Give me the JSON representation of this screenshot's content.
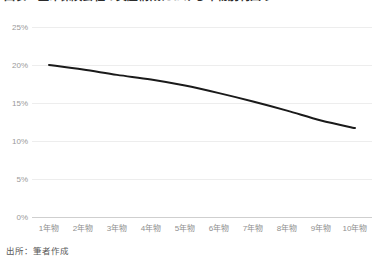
{
  "chart_data": {
    "type": "line",
    "title": "図表　生命保険会社の資産構成における年物別利回り",
    "subtitle": "",
    "xlabel": "",
    "ylabel": "",
    "categories": [
      "1年物",
      "2年物",
      "3年物",
      "4年物",
      "5年物",
      "6年物",
      "7年物",
      "8年物",
      "9年物",
      "10年物"
    ],
    "series": [
      {
        "name": "利回り",
        "color": "#1a1a1a",
        "values": [
          20.0,
          19.4,
          18.7,
          18.1,
          17.3,
          16.3,
          15.2,
          14.0,
          12.7,
          11.7
        ]
      }
    ],
    "ylim": [
      0,
      25
    ],
    "ytick_values": [
      25,
      20,
      15,
      10,
      5,
      0
    ],
    "ytick_labels": [
      "25%",
      "20%",
      "15%",
      "10%",
      "5%",
      "0%"
    ],
    "grid": true,
    "legend": false,
    "legend_position": "none"
  },
  "footer": {
    "source": "出所：筆者作成"
  }
}
